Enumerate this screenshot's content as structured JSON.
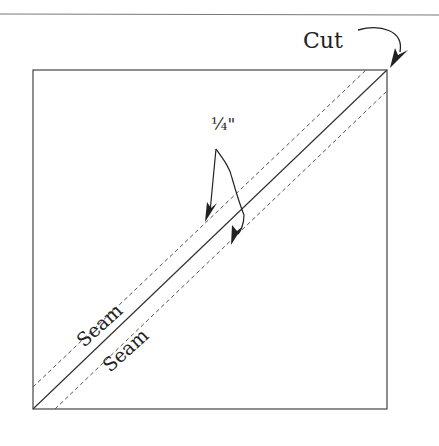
{
  "diagram": {
    "labels": {
      "cut": "Cut",
      "seam_allowance": "1/4\"",
      "seam_allowance_display": "¼\"",
      "seam_upper": "Seam",
      "seam_lower": "Seam"
    },
    "colors": {
      "line": "#333333",
      "dashed": "#555555",
      "rule": "#777777",
      "background": "#ffffff"
    },
    "square": {
      "x": 33,
      "y": 70,
      "size": 354
    },
    "lines": {
      "cut_diagonal": {
        "from": [
          33,
          409
        ],
        "to": [
          387,
          70
        ],
        "style": "solid"
      },
      "seam_upper": {
        "from": [
          33,
          387
        ],
        "to": [
          366,
          70
        ],
        "style": "dashed"
      },
      "seam_lower": {
        "from": [
          55,
          409
        ],
        "to": [
          387,
          91
        ],
        "style": "dashed"
      }
    }
  }
}
